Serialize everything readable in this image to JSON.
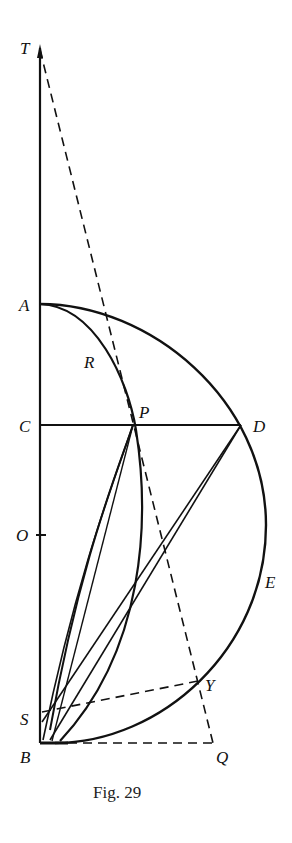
{
  "figure": {
    "caption": "Fig. 29",
    "labels": {
      "T": "T",
      "A": "A",
      "R": "R",
      "C": "C",
      "P": "P",
      "D": "D",
      "O": "O",
      "E": "E",
      "S": "S",
      "Y": "Y",
      "B": "B",
      "Q": "Q"
    },
    "colors": {
      "ink": "#111111",
      "background": "#ffffff"
    }
  }
}
